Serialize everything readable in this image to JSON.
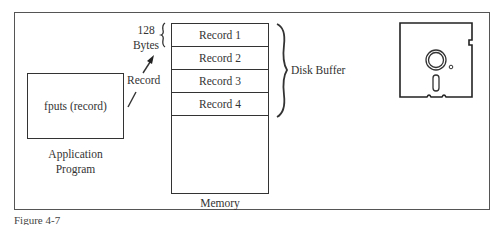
{
  "diagram": {
    "application": {
      "call_text": "fputs (record)",
      "label_line1": "Application",
      "label_line2": "Program"
    },
    "arrow_label": "Record",
    "size_label_line1": "128",
    "size_label_line2": "Bytes",
    "memory": {
      "label": "Memory",
      "records": [
        "Record 1",
        "Record 2",
        "Record 3",
        "Record 4"
      ]
    },
    "buffer_label": "Disk Buffer",
    "disk_icon": "floppy-disk-icon"
  },
  "caption": "Figure 4-7"
}
